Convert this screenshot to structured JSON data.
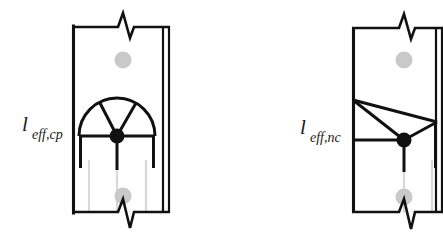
{
  "figure": {
    "type": "engineering-diagram",
    "panels": [
      {
        "id": "circular-pattern",
        "label_main": "l",
        "label_sub": "eff,cp",
        "pattern": "circular",
        "plate": {
          "x": 72,
          "y": 26,
          "width": 90,
          "height": 187
        },
        "double_edge_x": 168,
        "bolt": {
          "cx": 117,
          "cy": 136,
          "r": 7.5,
          "color": "#111111"
        },
        "holes": [
          {
            "cx": 123,
            "cy": 60,
            "r": 8.5,
            "color": "#c9c9c9"
          },
          {
            "cx": 123,
            "cy": 196,
            "r": 8.5,
            "color": "#c9c9c9"
          }
        ],
        "arc_radius": 38,
        "break_top": {
          "cx": 126,
          "y": 26,
          "dir": "down"
        },
        "break_bottom": {
          "cx": 126,
          "y": 213,
          "dir": "down"
        }
      },
      {
        "id": "noncircular-pattern",
        "label_main": "l",
        "label_sub": "eff,nc",
        "pattern": "non-circular",
        "plate": {
          "x": 352,
          "y": 27,
          "width": 88,
          "height": 186
        },
        "double_edge_x": 437,
        "bolt": {
          "cx": 404,
          "cy": 140,
          "r": 7.5,
          "color": "#111111"
        },
        "holes": [
          {
            "cx": 404,
            "cy": 60,
            "r": 8.5,
            "color": "#c9c9c9"
          },
          {
            "cx": 404,
            "cy": 197,
            "r": 8.5,
            "color": "#c9c9c9"
          }
        ],
        "apex": {
          "x": 353,
          "y": 100
        },
        "right_node": {
          "x": 437,
          "y": 122
        },
        "break_top": {
          "cx": 406,
          "y": 27,
          "dir": "down"
        },
        "break_bottom": {
          "cx": 406,
          "y": 213,
          "dir": "down"
        }
      }
    ],
    "colors": {
      "line": "#111111",
      "faint_line": "#d4d4d4",
      "hole": "#c9c9c9",
      "bolt": "#111111",
      "background": "#ffffff"
    }
  }
}
